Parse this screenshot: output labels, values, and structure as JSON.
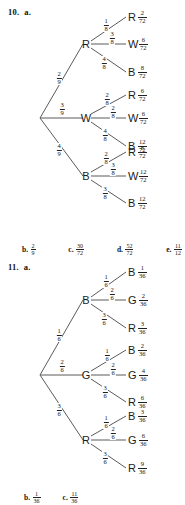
{
  "problems": [
    {
      "label": "10.",
      "part": "a.",
      "root_children": [
        {
          "letter": "R",
          "prob": {
            "num": "2",
            "den": "9"
          }
        },
        {
          "letter": "W",
          "prob": {
            "num": "3",
            "den": "9"
          }
        },
        {
          "letter": "B",
          "prob": {
            "num": "4",
            "den": "9"
          }
        }
      ],
      "leaves": [
        {
          "letter": "R",
          "edge": {
            "num": "1",
            "den": "8"
          },
          "value": {
            "num": "2",
            "den": "72"
          }
        },
        {
          "letter": "W",
          "edge": {
            "num": "3",
            "den": "8"
          },
          "value": {
            "num": "6",
            "den": "72"
          }
        },
        {
          "letter": "B",
          "edge": {
            "num": "4",
            "den": "8"
          },
          "value": {
            "num": "8",
            "den": "72"
          }
        },
        {
          "letter": "R",
          "edge": {
            "num": "2",
            "den": "8"
          },
          "value": {
            "num": "6",
            "den": "72"
          }
        },
        {
          "letter": "W",
          "edge": {
            "num": "2",
            "den": "8"
          },
          "value": {
            "num": "6",
            "den": "72"
          }
        },
        {
          "letter": "B",
          "edge": {
            "num": "4",
            "den": "8"
          },
          "value": {
            "num": "12",
            "den": "72"
          }
        },
        {
          "letter": "R",
          "edge": {
            "num": "2",
            "den": "8"
          },
          "value": {
            "num": "8",
            "den": "72"
          }
        },
        {
          "letter": "W",
          "edge": {
            "num": "3",
            "den": "8"
          },
          "value": {
            "num": "12",
            "den": "72"
          }
        },
        {
          "letter": "B",
          "edge": {
            "num": "3",
            "den": "8"
          },
          "value": {
            "num": "12",
            "den": "72"
          }
        }
      ],
      "answers": [
        {
          "tag": "b.",
          "num": "2",
          "den": "9"
        },
        {
          "tag": "c.",
          "num": "30",
          "den": "72"
        },
        {
          "tag": "d.",
          "num": "52",
          "den": "72"
        },
        {
          "tag": "e.",
          "num": "11",
          "den": "12"
        }
      ]
    },
    {
      "label": "11.",
      "part": "a.",
      "root_children": [
        {
          "letter": "B",
          "prob": {
            "num": "1",
            "den": "6"
          }
        },
        {
          "letter": "G",
          "prob": {
            "num": "2",
            "den": "6"
          }
        },
        {
          "letter": "R",
          "prob": {
            "num": "3",
            "den": "6"
          }
        }
      ],
      "leaves": [
        {
          "letter": "B",
          "edge": {
            "num": "1",
            "den": "6"
          },
          "value": {
            "num": "1",
            "den": "36"
          }
        },
        {
          "letter": "G",
          "edge": {
            "num": "2",
            "den": "6"
          },
          "value": {
            "num": "2",
            "den": "36"
          }
        },
        {
          "letter": "R",
          "edge": {
            "num": "3",
            "den": "6"
          },
          "value": {
            "num": "3",
            "den": "36"
          }
        },
        {
          "letter": "B",
          "edge": {
            "num": "1",
            "den": "6"
          },
          "value": {
            "num": "2",
            "den": "36"
          }
        },
        {
          "letter": "G",
          "edge": {
            "num": "2",
            "den": "6"
          },
          "value": {
            "num": "4",
            "den": "36"
          }
        },
        {
          "letter": "R",
          "edge": {
            "num": "3",
            "den": "6"
          },
          "value": {
            "num": "6",
            "den": "36"
          }
        },
        {
          "letter": "B",
          "edge": {
            "num": "1",
            "den": "6"
          },
          "value": {
            "num": "3",
            "den": "36"
          }
        },
        {
          "letter": "G",
          "edge": {
            "num": "2",
            "den": "6"
          },
          "value": {
            "num": "6",
            "den": "36"
          }
        },
        {
          "letter": "R",
          "edge": {
            "num": "3",
            "den": "6"
          },
          "value": {
            "num": "9",
            "den": "36"
          }
        }
      ],
      "answers": [
        {
          "tag": "b.",
          "num": "1",
          "den": "36"
        },
        {
          "tag": "c.",
          "num": "11",
          "den": "36"
        }
      ]
    }
  ]
}
